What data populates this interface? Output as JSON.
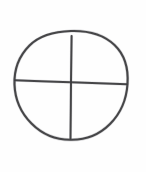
{
  "canvas": {
    "width": 146,
    "height": 172,
    "background_color": "#fefefe",
    "description": "Hand-drawn pencil sketch of a circle divided into four quadrants by a vertical and a horizontal line"
  },
  "style": {
    "ink_color": "#3a3a3c",
    "ink_soft_color": "#74747a",
    "stroke_width": 2.0,
    "medium": "pencil"
  },
  "drawing": {
    "name": "quartered-circle",
    "shapes": [
      {
        "id": "circle-outline",
        "type": "circle",
        "center_x": 71,
        "center_y": 85.5,
        "radius_x": 57,
        "radius_y": 54.5,
        "top_y": 31,
        "bottom_y": 140,
        "left_x": 14,
        "right_x": 128,
        "hand_drawn": true,
        "path": "M 71 31 C 88 30.5 104 35 114.5 45 C 125 55 128.5 69 127.5 84 C 126.5 99 121 113 110 124 C 99.5 134.5 85 140 71 139.8 C 56.5 140 42 134 31.5 123.5 C 21 113 15 99 14.5 84.5 C 14 70 19 56 29.5 45.5 C 40 35 54 31.5 71 31 Z"
      },
      {
        "id": "horizontal-diameter",
        "type": "line",
        "x1": 15,
        "y1": 80,
        "x2": 127,
        "y2": 84,
        "hand_drawn": true,
        "path": "M 15 80.2 C 35 81.2 55 81.8 71 82.2 C 92 82.8 112 83.6 126.8 84.2"
      },
      {
        "id": "vertical-diameter",
        "type": "line",
        "x1": 71.5,
        "y1": 36,
        "x2": 70.5,
        "y2": 139,
        "hand_drawn": true,
        "path": "M 71.6 36 C 71.3 55 71.1 70 71.0 82.2 C 70.9 100 70.7 122 70.5 138.8"
      }
    ],
    "intersection_point": {
      "x": 71,
      "y": 82
    }
  },
  "labels": {
    "alt_text": "A hand-drawn circle crossed by vertical and horizontal lines forming four quadrants"
  }
}
